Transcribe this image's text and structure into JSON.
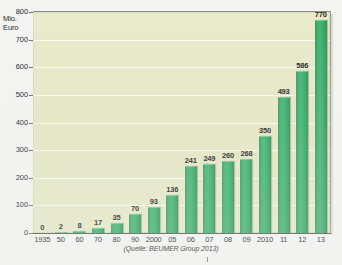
{
  "chart_data": {
    "type": "bar",
    "title": "",
    "subtitle": "",
    "xlabel": "",
    "ylabel": "Mio.\nEuro",
    "ylabel_lines": [
      "Mio.",
      "Euro"
    ],
    "ylim": [
      0,
      800
    ],
    "ytick_step": 100,
    "yticks": [
      "800",
      "700",
      "600",
      "500",
      "400",
      "300",
      "200",
      "100",
      "0"
    ],
    "grid": true,
    "grid_orientation": "horizontal",
    "legend": "none",
    "legend_position": "none",
    "source_note": "(Quelle: BEUMER Group 2013)",
    "categories": [
      "1935",
      "50",
      "60",
      "70",
      "80",
      "90",
      "2000",
      "05",
      "06",
      "07",
      "08",
      "09",
      "2010",
      "11",
      "12",
      "13"
    ],
    "values": [
      0,
      2,
      8,
      17,
      35,
      70,
      93,
      136,
      241,
      249,
      260,
      268,
      350,
      493,
      586,
      770
    ],
    "data_labels": [
      "0",
      "2",
      "8",
      "17",
      "35",
      "70",
      "93",
      "136",
      "241",
      "249",
      "260",
      "268",
      "350",
      "493",
      "586",
      "770"
    ],
    "series": [
      {
        "name": "Umsatz",
        "values": [
          0,
          2,
          8,
          17,
          35,
          70,
          93,
          136,
          241,
          249,
          260,
          268,
          350,
          493,
          586,
          770
        ]
      }
    ]
  },
  "colors": {
    "bar": "#36a663",
    "bar_light": "#41b571",
    "bar_dark": "#2c8f53",
    "plot_background": "#e6e8c6",
    "page_background": "#f4f5f2",
    "gridline": "#ffffff",
    "axis": "#55574f",
    "text": "#1d1d1b"
  }
}
